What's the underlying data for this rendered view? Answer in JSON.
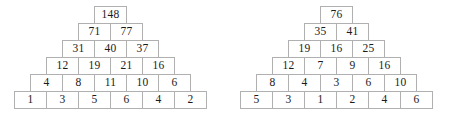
{
  "figure": {
    "type": "number-pyramid-pair",
    "background_color": "#ffffff",
    "cell_border_color": "#b0b0b0",
    "text_color": "#1a1a1a"
  },
  "pyramids": [
    {
      "name": "left",
      "rows": [
        [
          "148"
        ],
        [
          "71",
          "77"
        ],
        [
          "31",
          "40",
          "37"
        ],
        [
          "12",
          "19",
          "21",
          "16"
        ],
        [
          "4",
          "8",
          "11",
          "10",
          "6"
        ],
        [
          "1",
          "3",
          "5",
          "6",
          "4",
          "2"
        ]
      ]
    },
    {
      "name": "right",
      "rows": [
        [
          "76"
        ],
        [
          "35",
          "41"
        ],
        [
          "19",
          "16",
          "25"
        ],
        [
          "12",
          "7",
          "9",
          "16"
        ],
        [
          "8",
          "4",
          "3",
          "6",
          "10"
        ],
        [
          "5",
          "3",
          "1",
          "2",
          "4",
          "6"
        ]
      ]
    }
  ],
  "chart_data": {
    "type": "table",
    "title": "",
    "xlabel": "",
    "ylabel": "",
    "series": [
      {
        "name": "left",
        "levels": [
          {
            "level": 1,
            "values": [
              148
            ]
          },
          {
            "level": 2,
            "values": [
              71,
              77
            ]
          },
          {
            "level": 3,
            "values": [
              31,
              40,
              37
            ]
          },
          {
            "level": 4,
            "values": [
              12,
              19,
              21,
              16
            ]
          },
          {
            "level": 5,
            "values": [
              4,
              8,
              11,
              10,
              6
            ]
          },
          {
            "level": 6,
            "values": [
              1,
              3,
              5,
              6,
              4,
              2
            ]
          }
        ]
      },
      {
        "name": "right",
        "levels": [
          {
            "level": 1,
            "values": [
              76
            ]
          },
          {
            "level": 2,
            "values": [
              35,
              41
            ]
          },
          {
            "level": 3,
            "values": [
              19,
              16,
              25
            ]
          },
          {
            "level": 4,
            "values": [
              12,
              7,
              9,
              16
            ]
          },
          {
            "level": 5,
            "values": [
              8,
              4,
              3,
              6,
              10
            ]
          },
          {
            "level": 6,
            "values": [
              5,
              3,
              1,
              2,
              4,
              6
            ]
          }
        ]
      }
    ]
  }
}
